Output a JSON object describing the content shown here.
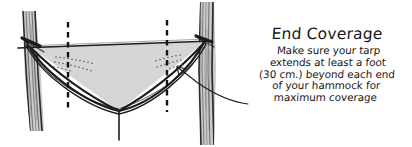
{
  "illustration": {
    "subject": "hammock-tarp-end-coverage-diagram",
    "style": "hand-drawn-ink-sketch",
    "background_color": "#ffffff",
    "ink_color": "#18181a",
    "tarp_fill_color": "#d4d4d4",
    "trunk_fill_color": "#c9c9c9"
  },
  "diagram": {
    "left_tree_label": "left-tree-trunk",
    "right_tree_label": "right-tree-trunk",
    "tarp_label": "tarp-canopy",
    "hammock_label": "hammock-body",
    "ridgeline_label": "ridgeline",
    "drip_line_label": "drip-line",
    "left_dashed_marker": "hammock-end-marker-left",
    "right_dashed_marker": "hammock-end-marker-right",
    "stitching_left_label": "stitching-detail-left",
    "stitching_right_label": "stitching-detail-right",
    "pointer_label": "annotation-pointer-arrow"
  },
  "annotation": {
    "title": "End Coverage",
    "body_lines": [
      "Make sure your tarp",
      "extends at least a foot",
      "(30 cm.) beyond each end",
      "of your hammock for",
      "maximum coverage"
    ]
  }
}
